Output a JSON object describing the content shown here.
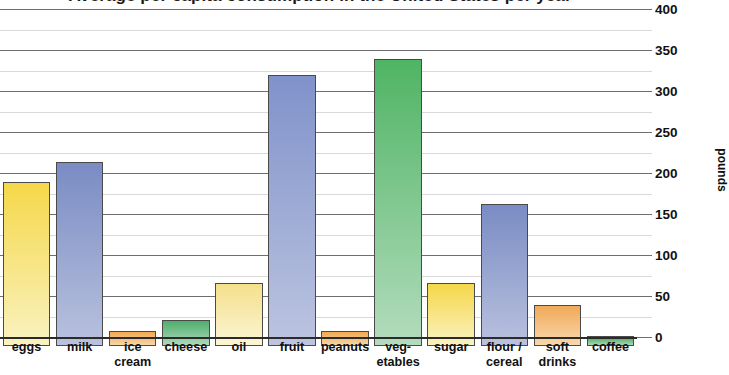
{
  "chart": {
    "title": "Average per capita consumption in the United States per year",
    "y_axis_title": "pounds",
    "y_tick_labels": [
      "400",
      "350",
      "300",
      "250",
      "200",
      "150",
      "100",
      "50",
      "0"
    ]
  },
  "chart_data": {
    "type": "bar",
    "title": "Average per capita consumption in the United States per year",
    "xlabel": "",
    "ylabel": "pounds",
    "ylim": [
      0,
      400
    ],
    "ytick_major_step": 50,
    "ytick_minor_step": 25,
    "grid": true,
    "legend": "none",
    "y_axis_position": "right",
    "categories": [
      "eggs",
      "milk",
      "ice cream",
      "cheese",
      "oil",
      "fruit",
      "peanuts",
      "veg-etables",
      "sugar",
      "flour / cereal",
      "soft drinks",
      "coffee"
    ],
    "category_label_lines": [
      [
        "eggs"
      ],
      [
        "milk"
      ],
      [
        "ice",
        "cream"
      ],
      [
        "cheese"
      ],
      [
        "oil"
      ],
      [
        "fruit"
      ],
      [
        "peanuts"
      ],
      [
        "veg-",
        "etables"
      ],
      [
        "sugar"
      ],
      [
        "flour /",
        "cereal"
      ],
      [
        "soft",
        "drinks"
      ],
      [
        "coffee"
      ]
    ],
    "values": [
      200,
      225,
      18,
      32,
      77,
      330,
      18,
      350,
      77,
      173,
      50,
      12
    ],
    "bar_colors": [
      "#f5d84a",
      "#7a8cc4",
      "#f0a950",
      "#4fae6b",
      "#f5e08c",
      "#8092ca",
      "#f0a950",
      "#4fb464",
      "#f5d84a",
      "#7a8cc4",
      "#f0a95a",
      "#47a858"
    ],
    "bar_colors_bottom": [
      "#faf2c0",
      "#b9c1de",
      "#f8d6a6",
      "#aed9bb",
      "#fbf5d4",
      "#bcc4e0",
      "#f8d6a6",
      "#b3dcbd",
      "#faf2c0",
      "#b9c1de",
      "#f9d8ab",
      "#abd7b6"
    ]
  }
}
